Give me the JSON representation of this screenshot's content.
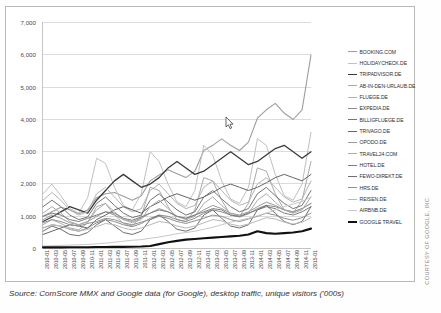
{
  "caption": "Source: ComScore MMX and Google data (for Google), desktop traffic, unique visitors ('000s)",
  "credit": "COURTESY OF GOOGLE, INC.",
  "cursor_icon": "mouse-pointer-icon",
  "chart_data": {
    "type": "line",
    "title": "",
    "xlabel": "",
    "ylabel": "",
    "ylim": [
      0,
      7000
    ],
    "ytick_labels": [
      "7,000",
      "6,000",
      "5,000",
      "4,000",
      "3,000",
      "2,000",
      "1,000",
      "0"
    ],
    "ytick_values": [
      7000,
      6000,
      5000,
      4000,
      3000,
      2000,
      1000,
      0
    ],
    "grid": true,
    "legend_position": "right",
    "x": [
      "2010-01",
      "2010-03",
      "2010-05",
      "2010-07",
      "2010-09",
      "2010-11",
      "2011-01",
      "2011-03",
      "2011-05",
      "2011-07",
      "2011-09",
      "2011-11",
      "2012-01",
      "2012-03",
      "2012-05",
      "2012-07",
      "2012-09",
      "2012-11",
      "2013-01",
      "2013-03",
      "2013-05",
      "2013-07",
      "2013-09",
      "2013-11",
      "2014-01",
      "2014-03",
      "2014-05",
      "2014-07",
      "2014-09",
      "2014-11",
      "2015-01"
    ],
    "xtick_labels": [
      "2010-01",
      "2010-03",
      "2010-05",
      "2010-07",
      "2010-09",
      "2010-11",
      "2011-01",
      "2011-03",
      "2011-05",
      "2011-07",
      "2011-09",
      "2011-11",
      "2012-01",
      "2012-03",
      "2012-05",
      "2012-07",
      "2012-09",
      "2012-11",
      "2013-01",
      "2013-03",
      "2013-05",
      "2013-07",
      "2013-09",
      "2013-11",
      "2014-01",
      "2014-03",
      "2014-05",
      "2014-07",
      "2014-09",
      "2014-11",
      "2015-01"
    ],
    "series": [
      {
        "name": "BOOKING.COM",
        "color": "#9e9e9e",
        "width": 1.1,
        "values": [
          980,
          1120,
          1260,
          1180,
          1060,
          1180,
          1560,
          1680,
          1720,
          1600,
          1480,
          1620,
          2080,
          2260,
          2420,
          2300,
          2180,
          2380,
          3020,
          3180,
          3380,
          3180,
          3020,
          3280,
          4020,
          4280,
          4480,
          4180,
          3980,
          4280,
          5980
        ]
      },
      {
        "name": "HOLIDAYCHECK.DE",
        "color": "#c0c0c0",
        "width": 1.0,
        "values": [
          1680,
          1980,
          1620,
          1220,
          1080,
          1560,
          2780,
          2620,
          1880,
          1320,
          1180,
          1680,
          2980,
          2680,
          1980,
          1420,
          1280,
          1780,
          3180,
          2880,
          2080,
          1520,
          1380,
          1880,
          3380,
          3180,
          2280,
          1620,
          1480,
          1980,
          3580
        ]
      },
      {
        "name": "TRIPADVISOR.DE",
        "color": "#3a3a3a",
        "width": 1.3,
        "values": [
          820,
          960,
          1120,
          1280,
          1180,
          1080,
          1480,
          1780,
          2080,
          2280,
          2080,
          1880,
          1980,
          2180,
          2480,
          2680,
          2480,
          2280,
          2380,
          2580,
          2780,
          2980,
          2780,
          2580,
          2680,
          2880,
          3080,
          3180,
          2980,
          2780,
          2980
        ]
      },
      {
        "name": "AB-IN-DEN-URLAUB.DE",
        "color": "#aaaaaa",
        "width": 1.0,
        "values": [
          720,
          880,
          760,
          620,
          560,
          780,
          1280,
          1380,
          1020,
          760,
          680,
          980,
          1880,
          1780,
          1280,
          880,
          820,
          1180,
          2180,
          2080,
          1480,
          1020,
          980,
          1380,
          2480,
          2380,
          1680,
          1180,
          1080,
          1480,
          2680
        ]
      },
      {
        "name": "FLUEGE.DE",
        "color": "#b4b4b4",
        "width": 1.0,
        "values": [
          1480,
          1720,
          1480,
          1180,
          1020,
          1120,
          1680,
          1880,
          1580,
          1280,
          1120,
          1220,
          1780,
          1980,
          1680,
          1380,
          1220,
          1320,
          1880,
          2080,
          1780,
          1480,
          1320,
          1420,
          1980,
          2180,
          1880,
          1580,
          1420,
          1520,
          2080
        ]
      },
      {
        "name": "EXPEDIA.DE",
        "color": "#8c8c8c",
        "width": 1.0,
        "values": [
          620,
          720,
          680,
          580,
          520,
          620,
          780,
          880,
          820,
          720,
          660,
          760,
          920,
          1020,
          980,
          880,
          820,
          920,
          1080,
          1180,
          1120,
          1020,
          960,
          1060,
          1220,
          1320,
          1280,
          1180,
          1120,
          1220,
          1380
        ]
      },
      {
        "name": "BILLIGFLUEGE.DE",
        "color": "#757575",
        "width": 1.0,
        "values": [
          1280,
          1480,
          1280,
          1020,
          880,
          960,
          1380,
          1580,
          1320,
          1080,
          940,
          1020,
          1480,
          1680,
          1420,
          1180,
          1020,
          1120,
          1580,
          1780,
          1520,
          1280,
          1120,
          1220,
          1680,
          1880,
          1620,
          1380,
          1220,
          1320,
          1780
        ]
      },
      {
        "name": "TRIVAGO.DE",
        "color": "#666666",
        "width": 1.0,
        "values": [
          420,
          520,
          620,
          720,
          680,
          620,
          880,
          1020,
          1180,
          1280,
          1180,
          1080,
          1280,
          1420,
          1580,
          1680,
          1580,
          1480,
          1580,
          1720,
          1880,
          1980,
          1880,
          1780,
          1880,
          2020,
          2180,
          2280,
          2180,
          2080,
          2280
        ]
      },
      {
        "name": "OPODO.DE",
        "color": "#9a9a9a",
        "width": 1.0,
        "values": [
          880,
          1020,
          920,
          780,
          720,
          820,
          980,
          1120,
          1020,
          880,
          820,
          920,
          1080,
          1220,
          1120,
          980,
          920,
          1020,
          1180,
          1320,
          1220,
          1080,
          1020,
          1120,
          1280,
          1420,
          1320,
          1180,
          1120,
          1220,
          1380
        ]
      },
      {
        "name": "TRAVEL24.COM",
        "color": "#ababab",
        "width": 1.0,
        "values": [
          1080,
          1280,
          1080,
          820,
          720,
          820,
          1180,
          1380,
          1120,
          880,
          780,
          880,
          1280,
          1480,
          1220,
          980,
          880,
          980,
          1380,
          1580,
          1320,
          1080,
          980,
          1080,
          1480,
          1680,
          1420,
          1180,
          1080,
          1180,
          1580
        ]
      },
      {
        "name": "HOTEL.DE",
        "color": "#7e7e7e",
        "width": 1.0,
        "values": [
          980,
          1080,
          1020,
          880,
          820,
          920,
          1020,
          1120,
          1080,
          920,
          860,
          960,
          1080,
          1180,
          1120,
          980,
          920,
          1020,
          1120,
          1220,
          1180,
          1020,
          980,
          1080,
          1180,
          1280,
          1220,
          1080,
          1020,
          1120,
          1280
        ]
      },
      {
        "name": "FEWO-DIREKT.DE",
        "color": "#6e6e6e",
        "width": 1.0,
        "values": [
          520,
          680,
          580,
          420,
          380,
          480,
          720,
          880,
          680,
          480,
          420,
          520,
          880,
          1020,
          820,
          580,
          520,
          620,
          1020,
          1180,
          920,
          680,
          620,
          720,
          1180,
          1320,
          1080,
          820,
          720,
          820,
          1280
        ]
      },
      {
        "name": "HRS.DE",
        "color": "#909090",
        "width": 1.0,
        "values": [
          780,
          880,
          820,
          720,
          680,
          760,
          820,
          920,
          880,
          780,
          720,
          800,
          880,
          980,
          920,
          820,
          760,
          840,
          920,
          1020,
          980,
          880,
          820,
          900,
          980,
          1080,
          1020,
          920,
          860,
          940,
          1080
        ]
      },
      {
        "name": "REISEN.DE",
        "color": "#b8b8b8",
        "width": 1.0,
        "values": [
          620,
          720,
          680,
          580,
          520,
          580,
          660,
          760,
          720,
          620,
          560,
          620,
          720,
          820,
          780,
          680,
          620,
          680,
          780,
          880,
          840,
          740,
          680,
          740,
          840,
          940,
          900,
          800,
          740,
          800,
          940
        ]
      },
      {
        "name": "AIRBNB.DE",
        "color": "#c8c8c8",
        "width": 1.0,
        "values": [
          60,
          70,
          80,
          90,
          100,
          110,
          130,
          150,
          180,
          210,
          240,
          260,
          300,
          340,
          390,
          440,
          480,
          520,
          580,
          640,
          720,
          800,
          860,
          920,
          1000,
          1080,
          1180,
          1280,
          1360,
          1440,
          1580
        ]
      },
      {
        "name": "GOOGLE TRAVEL",
        "color": "#111111",
        "width": 2.1,
        "values": [
          20,
          20,
          20,
          25,
          25,
          25,
          30,
          30,
          35,
          35,
          40,
          45,
          60,
          120,
          180,
          220,
          260,
          280,
          300,
          320,
          340,
          360,
          380,
          420,
          520,
          460,
          440,
          460,
          480,
          520,
          600
        ]
      }
    ]
  }
}
